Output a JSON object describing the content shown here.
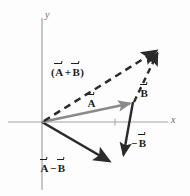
{
  "figure": {
    "type": "vector-diagram",
    "background_color": "#fdfdfd",
    "axes": {
      "color": "#9a9a9a",
      "x_label": "x",
      "y_label": "y",
      "origin": [
        42,
        122
      ],
      "x_range_px": [
        8,
        168
      ],
      "y_range_px": [
        18,
        190
      ],
      "tick_x": 115
    },
    "vectors": [
      {
        "name": "A",
        "label": "A",
        "style": "solid",
        "color": "#8a8a8a",
        "from": [
          42,
          122
        ],
        "to": [
          133,
          103
        ]
      },
      {
        "name": "B",
        "label": "B",
        "style": "dashed",
        "color": "#2a2a2a",
        "from": [
          133,
          103
        ],
        "to": [
          160,
          48
        ]
      },
      {
        "name": "A_plus_B",
        "label": "(A + B)",
        "style": "dashed",
        "color": "#2a2a2a",
        "from": [
          42,
          122
        ],
        "to": [
          160,
          48
        ]
      },
      {
        "name": "minus_B",
        "label": "- B",
        "style": "solid",
        "color": "#2a2a2a",
        "from": [
          133,
          103
        ],
        "to": [
          122,
          160
        ]
      },
      {
        "name": "A_minus_B",
        "label": "A - B",
        "style": "solid",
        "color": "#2a2a2a",
        "from": [
          42,
          122
        ],
        "to": [
          112,
          163
        ]
      }
    ],
    "labels": {
      "a_plus_b": {
        "open_paren": "(",
        "first": "A",
        "operator": "+",
        "second": "B",
        "close_paren": ")"
      },
      "a": {
        "letter": "A"
      },
      "b": {
        "letter": "B"
      },
      "minus_b": {
        "operator": "−",
        "letter": "B"
      },
      "a_minus_b": {
        "first": "A",
        "operator": "−",
        "second": "B"
      }
    }
  }
}
